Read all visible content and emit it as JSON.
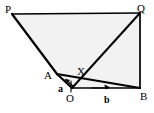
{
  "figure": {
    "background_color": "#ffffff",
    "fill_color": "#f2f2f2",
    "stroke_color": "#000000"
  },
  "points": {
    "P": {
      "label": "P",
      "x": 12,
      "y": 14,
      "label_x": 6,
      "label_y": 11
    },
    "Q": {
      "label": "Q",
      "x": 140,
      "y": 13,
      "label_x": 139,
      "label_y": 10
    },
    "A": {
      "label": "A",
      "x": 57,
      "y": 74,
      "label_x": 48,
      "label_y": 77
    },
    "X": {
      "label": "X",
      "x": 84,
      "y": 78,
      "label_x": 80,
      "label_y": 74
    },
    "O": {
      "label": "O",
      "x": 72,
      "y": 88,
      "label_x": 70,
      "label_y": 101
    },
    "B": {
      "label": "B",
      "x": 140,
      "y": 88,
      "label_x": 142,
      "label_y": 99
    }
  },
  "vectors": {
    "a": {
      "label": "a",
      "from": "O",
      "to": "A",
      "label_x": 60,
      "label_y": 89,
      "arrow_tail_x": 73,
      "arrow_tail_y": 86,
      "arrow_head_x": 66,
      "arrow_head_y": 80
    },
    "b": {
      "label": "b",
      "from": "O",
      "to": "B",
      "label_x": 107,
      "label_y": 102,
      "arrow_tail_x": 92,
      "arrow_tail_y": 88,
      "arrow_head_x": 108,
      "arrow_head_y": 88
    }
  },
  "segments": [
    {
      "name": "segment-P-Q",
      "from": "P",
      "to": "Q"
    },
    {
      "name": "segment-P-A",
      "from": "P",
      "to": "A"
    },
    {
      "name": "segment-A-O",
      "from": "A",
      "to": "O"
    },
    {
      "name": "segment-O-B",
      "from": "O",
      "to": "B"
    },
    {
      "name": "segment-Q-B",
      "from": "Q",
      "to": "B"
    },
    {
      "name": "segment-A-B",
      "from": "A",
      "to": "B"
    },
    {
      "name": "segment-O-Q",
      "from": "O",
      "to": "Q"
    }
  ],
  "regions": [
    {
      "name": "region-PQBOA",
      "vertices": [
        "P",
        "Q",
        "B",
        "O",
        "A"
      ]
    }
  ]
}
